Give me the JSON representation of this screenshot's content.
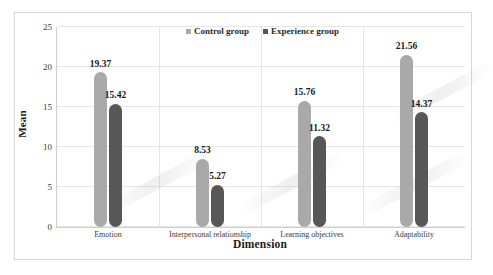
{
  "chart_data": {
    "type": "bar",
    "title": "",
    "xlabel": "Dimension",
    "ylabel": "Mean",
    "ylim": [
      0,
      25
    ],
    "yticks": [
      0,
      5,
      10,
      15,
      20,
      25
    ],
    "grid": true,
    "legend_position": "top-center",
    "categories": [
      "Emotion",
      "Interpersonal relationship",
      "Learning objectives",
      "Adaptability"
    ],
    "series": [
      {
        "name": "Control group",
        "color": "#a9a9a9",
        "values": [
          19.37,
          8.53,
          15.76,
          21.56
        ],
        "value_labels": [
          "19.37",
          "8.53",
          "15.76",
          "21.56"
        ]
      },
      {
        "name": "Experience group",
        "color": "#575757",
        "values": [
          15.42,
          5.27,
          11.32,
          14.37
        ],
        "value_labels": [
          "15.42",
          "5.27",
          "11.32",
          "14.37"
        ]
      }
    ]
  },
  "axis": {
    "y_tick_labels": [
      "25",
      "20",
      "15",
      "10",
      "5",
      "0"
    ],
    "y_title": "Mean",
    "x_title": "Dimension"
  },
  "legend": {
    "items": [
      {
        "label": "Control group",
        "marker": "square-marker"
      },
      {
        "label": "Experience group",
        "marker": "square-marker"
      }
    ]
  }
}
